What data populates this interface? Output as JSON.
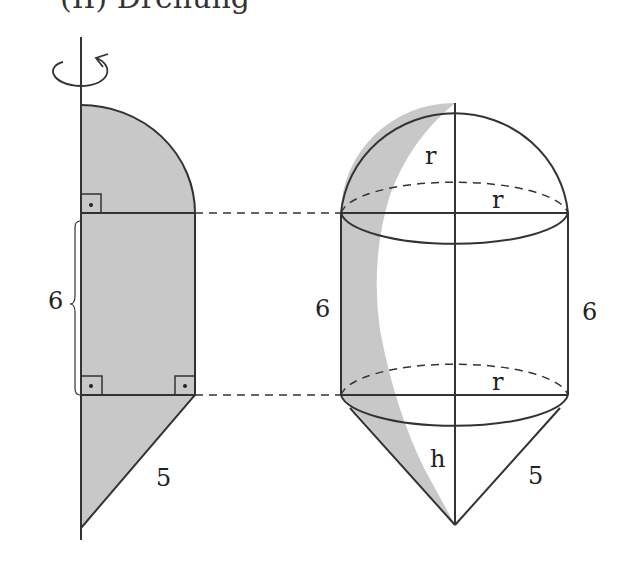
{
  "header": {
    "partial_text": "(II) Drehung"
  },
  "colors": {
    "fill": "#c8c8c8",
    "stroke": "#333333",
    "background": "#ffffff"
  },
  "left_figure": {
    "description": "Cross-section rotated around vertical axis: quarter circle, rectangle, right triangle",
    "rotation_icon": "rotation-arrow-icon",
    "labels": {
      "rect_height": "6",
      "hypotenuse": "5"
    },
    "right_angle_markers": 3
  },
  "right_figure": {
    "description": "Solid of revolution: hemisphere + cylinder + cone",
    "labels": {
      "hemisphere_height": "r",
      "top_radius": "r",
      "cyl_height_left": "6",
      "cyl_height_right": "6",
      "bottom_radius": "r",
      "cone_height": "h",
      "cone_slant": "5"
    }
  }
}
